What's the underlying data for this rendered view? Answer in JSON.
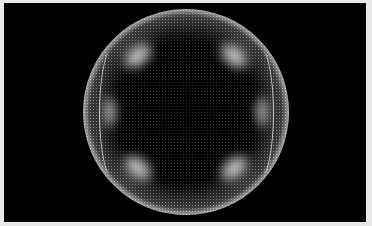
{
  "image": {
    "subject": "glowing wireframe sphere of fine white dots on black background",
    "colors": {
      "background": "#000000",
      "frame": "#e8e8e8",
      "highlight": "#ffffff"
    }
  }
}
